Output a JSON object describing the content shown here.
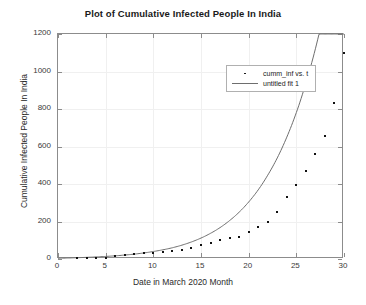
{
  "chart_data": {
    "type": "scatter",
    "title": "Plot of Cumulative Infected People In India",
    "xlabel": "Date in March 2020 Month",
    "ylabel": "Cumulative Infected People In India",
    "xlim": [
      0,
      30
    ],
    "ylim": [
      0,
      1200
    ],
    "xticks": [
      0,
      5,
      10,
      15,
      20,
      25,
      30
    ],
    "yticks": [
      0,
      200,
      400,
      600,
      800,
      1000,
      1200
    ],
    "grid": true,
    "legend_position": "top-center",
    "legend": [
      {
        "label": "cumm_inf vs. t",
        "marker": "dot",
        "color": "#111111"
      },
      {
        "label": "untitled fit 1",
        "marker": "line",
        "color": "#6e6e6e"
      }
    ],
    "series": [
      {
        "name": "cumm_inf vs. t",
        "type": "scatter",
        "color": "#111111",
        "x": [
          2,
          3,
          4,
          5,
          6,
          7,
          8,
          9,
          10,
          11,
          12,
          13,
          14,
          15,
          16,
          17,
          18,
          19,
          20,
          21,
          22,
          23,
          24,
          25,
          26,
          27,
          28,
          29,
          30
        ],
        "y": [
          3,
          5,
          6,
          8,
          14,
          22,
          28,
          31,
          34,
          39,
          43,
          50,
          60,
          74,
          84,
          102,
          113,
          119,
          142,
          173,
          195,
          252,
          330,
          396,
          468,
          562,
          657,
          834,
          1100
        ]
      },
      {
        "name": "untitled fit 1",
        "type": "line",
        "color": "#6e6e6e",
        "x": [
          0,
          2,
          4,
          6,
          8,
          10,
          12,
          14,
          16,
          18,
          20,
          22,
          24,
          26,
          28,
          30
        ],
        "y": [
          4,
          7,
          11,
          17,
          26,
          40,
          60,
          91,
          137,
          205,
          304,
          447,
          650,
          938,
          1340,
          1230
        ]
      }
    ]
  },
  "figure": {
    "background": "#ffffff",
    "axis_color": "#8c8c8c",
    "grid_color": "#f0f0f0"
  }
}
